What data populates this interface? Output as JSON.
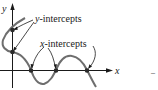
{
  "diagram": {
    "axes": {
      "x_label": "x",
      "y_label": "y"
    },
    "annotations": {
      "y_intercepts": {
        "var": "y",
        "rest": "-intercepts"
      },
      "x_intercepts": {
        "var": "x",
        "rest": "-intercepts"
      }
    },
    "points": {
      "y_intercepts": [
        [
          12,
          30
        ],
        [
          12,
          52
        ]
      ],
      "x_intercepts": [
        [
          31,
          70
        ],
        [
          56,
          70
        ],
        [
          87,
          70
        ]
      ]
    },
    "colors": {
      "curve": "#6e6e6e",
      "axis": "#1a1a1a",
      "point": "#2a2a2a",
      "text": "#1a1a1a"
    },
    "trailing_mark": "–"
  }
}
